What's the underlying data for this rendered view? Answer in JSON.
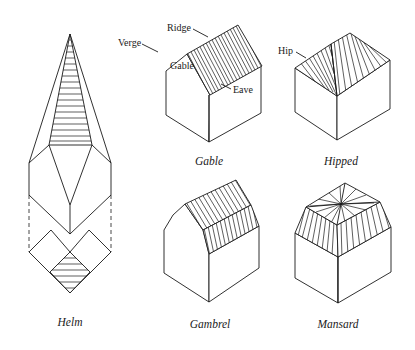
{
  "figure": {
    "colors": {
      "ink": "#1a1a1a",
      "paper": "#ffffff"
    }
  },
  "diagrams": {
    "helm": {
      "caption": "Helm"
    },
    "gable": {
      "caption": "Gable",
      "labels": {
        "ridge": "Ridge",
        "verge": "Verge",
        "gable": "Gable",
        "eave": "Eave"
      }
    },
    "hipped": {
      "caption": "Hipped",
      "labels": {
        "hip": "Hip"
      }
    },
    "gambrel": {
      "caption": "Gambrel"
    },
    "mansard": {
      "caption": "Mansard"
    }
  }
}
